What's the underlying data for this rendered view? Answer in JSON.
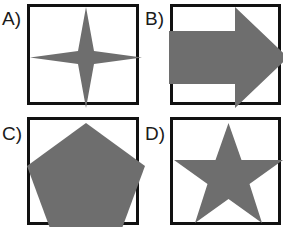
{
  "canvas": {
    "width": 283,
    "height": 231,
    "background_color": "#ffffff"
  },
  "style": {
    "shape_fill": "#6e6e6e",
    "box_border_color": "#111111",
    "box_border_width": 3,
    "box_fill": "#ffffff",
    "label_color": "#1a1a1a"
  },
  "panels": [
    {
      "id": "a",
      "label": "A)",
      "shape_name": "four-pointed-star",
      "shape_description": "four pointed star",
      "fill": "#6e6e6e",
      "points": "56,0 64,44 112,50.5 64,57 56,101 48,57 0,50.5 48,44"
    },
    {
      "id": "b",
      "label": "B)",
      "shape_name": "right-arrow",
      "shape_description": "right pointing arrow",
      "fill": "#6e6e6e",
      "points": "-4,24 62,24 62,0 115,50.5 62,101 62,77 -4,77"
    },
    {
      "id": "c",
      "label": "C)",
      "shape_name": "pentagon",
      "shape_description": "regular pentagon",
      "fill": "#6e6e6e",
      "points": "56,3 115,46 92.5,107 19.5,107 -3,46"
    },
    {
      "id": "d",
      "label": "D)",
      "shape_name": "five-pointed-star",
      "shape_description": "five pointed star",
      "fill": "#6e6e6e",
      "points": "55.5,3 68.5,40 110,40 76.5,64 89,103 55.5,79 22,103 34.5,64 1,40 42.5,40"
    }
  ]
}
